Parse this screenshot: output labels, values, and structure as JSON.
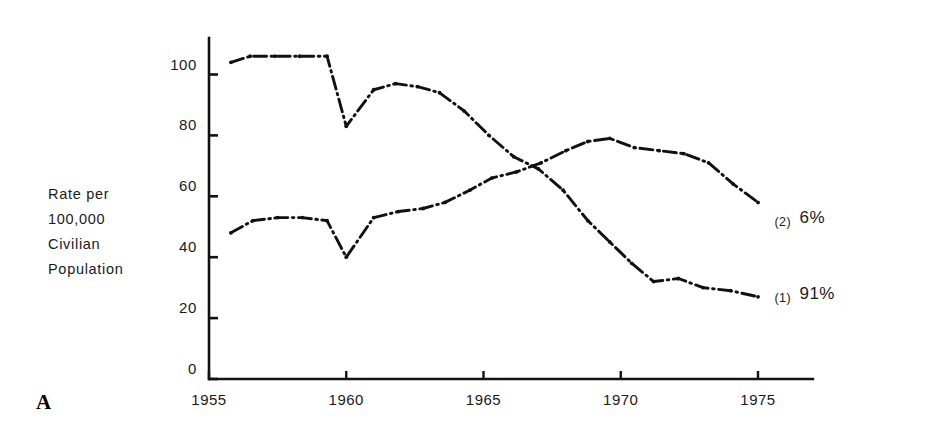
{
  "figure": {
    "panel_letter": "A",
    "axis_title_lines": [
      "Rate per",
      "100,000",
      "Civilian",
      "Population"
    ]
  },
  "chart_data": {
    "type": "line",
    "title": "",
    "xlabel": "",
    "ylabel": "Rate per 100,000 Civilian Population",
    "xlim": [
      1954.5,
      1977.0
    ],
    "ylim": [
      0,
      112
    ],
    "yticks": [
      0,
      20,
      40,
      60,
      80,
      100
    ],
    "ytick_labels": [
      "0",
      "20",
      "40",
      "60",
      "80",
      "100"
    ],
    "xticks": [
      1955,
      1960,
      1965,
      1970,
      1975
    ],
    "xtick_labels": [
      "1955",
      "1960",
      "1965",
      "1970",
      "1975"
    ],
    "grid": false,
    "legend_position": "right-inline",
    "line_style": "dash-dot",
    "line_color": "#111111",
    "series": [
      {
        "name": "(1)",
        "label": "(1) 91%",
        "label_number": "(1)",
        "label_value": "91%",
        "end_label_x": 1975.6,
        "end_label_y": 27,
        "x": [
          1955.8,
          1956.5,
          1957.4,
          1958.3,
          1959.3,
          1960.0,
          1961.0,
          1961.8,
          1962.6,
          1963.4,
          1964.3,
          1965.2,
          1966.1,
          1967.0,
          1967.9,
          1968.8,
          1969.6,
          1970.4,
          1971.2,
          1972.1,
          1973.0,
          1974.0,
          1975.0
        ],
        "y": [
          104,
          106,
          106,
          106,
          106,
          83,
          95,
          97,
          96,
          94,
          88,
          80,
          73,
          69,
          62,
          52,
          45,
          38,
          32,
          33,
          30,
          29,
          27
        ]
      },
      {
        "name": "(2)",
        "label": "(2) 6%",
        "label_number": "(2)",
        "label_value": "6%",
        "end_label_x": 1975.6,
        "end_label_y": 52,
        "x": [
          1955.8,
          1956.6,
          1957.5,
          1958.4,
          1959.3,
          1960.0,
          1961.0,
          1961.9,
          1962.8,
          1963.6,
          1964.5,
          1965.3,
          1966.2,
          1967.1,
          1968.0,
          1968.8,
          1969.6,
          1970.5,
          1971.4,
          1972.3,
          1973.2,
          1974.1,
          1975.0
        ],
        "y": [
          48,
          52,
          53,
          53,
          52,
          40,
          53,
          55,
          56,
          58,
          62,
          66,
          68,
          71,
          75,
          78,
          79,
          76,
          75,
          74,
          71,
          64,
          58
        ]
      }
    ]
  }
}
